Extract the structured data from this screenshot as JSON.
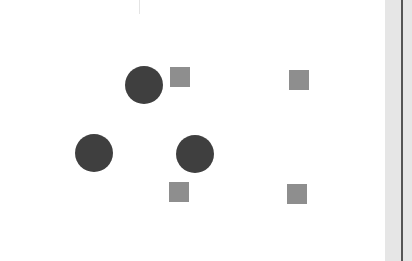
{
  "figure": {
    "background": "#ffffff",
    "colors": {
      "circle": "#3f3f3f",
      "square": "#8e8e8e",
      "margin_strip": "#e6e6e6",
      "margin_line": "#555555"
    },
    "circles": [
      {
        "id": "circle-1",
        "cx": 144,
        "cy": 85,
        "r": 19
      },
      {
        "id": "circle-2",
        "cx": 94,
        "cy": 153,
        "r": 19
      },
      {
        "id": "circle-3",
        "cx": 195,
        "cy": 154,
        "r": 19
      }
    ],
    "squares": [
      {
        "id": "square-1",
        "x": 170,
        "y": 67,
        "size": 20
      },
      {
        "id": "square-2",
        "x": 289,
        "y": 70,
        "size": 20
      },
      {
        "id": "square-3",
        "x": 169,
        "y": 182,
        "size": 20
      },
      {
        "id": "square-4",
        "x": 287,
        "y": 184,
        "size": 20
      }
    ],
    "margin": {
      "strip_x": 385,
      "strip_width": 27,
      "line_x": 401
    }
  }
}
